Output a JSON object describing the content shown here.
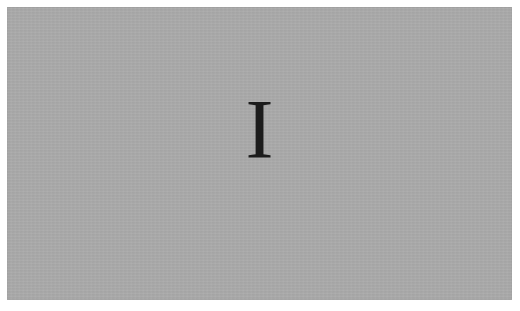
{
  "panel": {
    "background_color": "#aaaaaa",
    "glyph": "I",
    "glyph_color": "#1c1c1c"
  }
}
